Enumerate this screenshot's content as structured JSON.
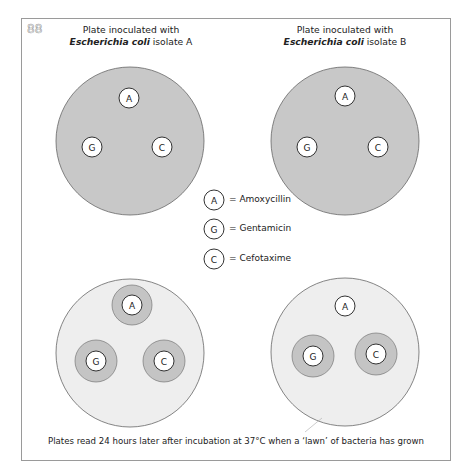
{
  "figure": {
    "number": "88",
    "caption": "Plates read 24 hours later after incubation at 37°C when a ‘lawn’ of bacteria has grown"
  },
  "plates": {
    "a": {
      "title_line1": "Plate inoculated with",
      "species": "Escherichia coli",
      "isolate": " isolate A"
    },
    "b": {
      "title_line1": "Plate inoculated with",
      "species": "Escherichia coli",
      "isolate": " isolate B"
    }
  },
  "disk_labels": {
    "amoxycillin": "A",
    "gentamicin": "G",
    "cefotaxime": "C"
  },
  "legend": [
    {
      "code": "A",
      "text": "= Amoxycillin"
    },
    {
      "code": "G",
      "text": "= Gentamicin"
    },
    {
      "code": "C",
      "text": "= Cefotaxime"
    }
  ],
  "results_after_24h": {
    "isolate_a": {
      "A": "inhibition zone",
      "G": "inhibition zone",
      "C": "inhibition zone"
    },
    "isolate_b": {
      "A": "no inhibition zone",
      "G": "inhibition zone",
      "C": "inhibition zone"
    }
  },
  "colors": {
    "dense_lawn": "#c8c8c8",
    "light_lawn": "#eeeeee",
    "inhibition_zone": "#c4c4c4",
    "disk": "#ffffff",
    "stroke": "#555555"
  }
}
